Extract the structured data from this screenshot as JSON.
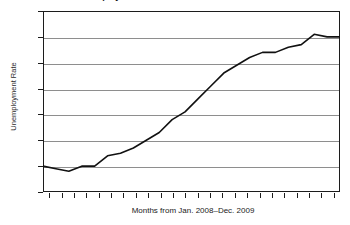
{
  "chart_data": {
    "type": "line",
    "title": "Unemployment Rate from Jan. 2008–Dec. 2009",
    "xlabel": "Months from Jan. 2008–Dec. 2009",
    "ylabel": "Unemployment Rate",
    "ylim": [
      4,
      11
    ],
    "xlim": [
      1,
      24
    ],
    "grid": true,
    "legend": "none",
    "y_ticks": [
      11,
      10,
      9,
      8,
      7,
      6,
      5,
      4
    ],
    "y_tick_labels": [
      "11",
      "10",
      "9",
      "8",
      "7",
      "6",
      "5",
      "4"
    ],
    "x_tick_count": 24,
    "x_tick_labels": [],
    "line_color": "#111111",
    "grid_color": "#8e8e8e",
    "axis_color": "#1c1c1c",
    "background_color": "#ffffff",
    "categories": [
      1,
      2,
      3,
      4,
      5,
      6,
      7,
      8,
      9,
      10,
      11,
      12,
      13,
      14,
      15,
      16,
      17,
      18,
      19,
      20,
      21,
      22,
      23,
      24
    ],
    "values": [
      5.0,
      4.9,
      4.8,
      5.0,
      5.0,
      5.4,
      5.5,
      5.7,
      6.0,
      6.3,
      6.8,
      7.1,
      7.6,
      8.1,
      8.6,
      8.9,
      9.2,
      9.4,
      9.4,
      9.6,
      9.7,
      10.1,
      10.0,
      10.0
    ]
  }
}
